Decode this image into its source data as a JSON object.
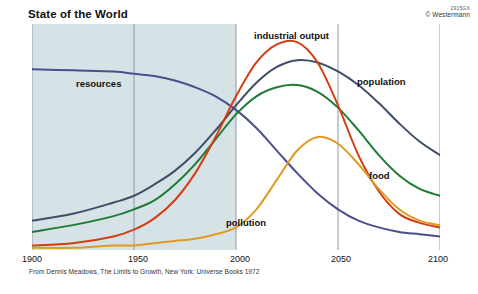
{
  "title": "State of the World",
  "credit": {
    "code": "2915GX",
    "owner": "© Westermann"
  },
  "source_note": "From Dennis Meadows, The Limits to Growth, New York: Universe Books 1972",
  "labels": {
    "resources": "resources",
    "industrial_output": "industrial output",
    "population": "population",
    "food": "food",
    "pollution": "pollution"
  },
  "axis": {
    "ticks": [
      "1900",
      "1950",
      "2000",
      "2100"
    ],
    "tick_2050": "2050"
  },
  "colors": {
    "resources": "#4a4f8c",
    "population": "#3d4f66",
    "food": "#1f7a35",
    "industrial_output": "#d23d12",
    "pollution": "#e09a22",
    "shading": "#d6e3e6",
    "gridline": "#8c9aa5"
  },
  "chart_data": {
    "type": "line",
    "title": "State of the World",
    "xlabel": "",
    "ylabel": "",
    "xlim": [
      1900,
      2100
    ],
    "ylim": [
      0,
      100
    ],
    "grid": true,
    "gridlines_x": [
      1900,
      1950,
      2000,
      2050,
      2100
    ],
    "tick_labels": [
      "1900",
      "1950",
      "2000",
      "2050",
      "2100"
    ],
    "legend": "inline-labels",
    "shaded_region": {
      "from": 1900,
      "to": 2000,
      "note": "historical period shading"
    },
    "x": [
      1900,
      1920,
      1940,
      1950,
      1960,
      1970,
      1980,
      1990,
      2000,
      2010,
      2020,
      2030,
      2040,
      2050,
      2060,
      2070,
      2080,
      2090,
      2100
    ],
    "series": [
      {
        "name": "resources",
        "color": "#4a4f8c",
        "values": [
          80,
          79.5,
          79,
          78,
          77,
          75,
          72,
          68,
          62,
          54,
          44,
          34,
          25,
          18,
          13,
          10,
          8,
          7,
          6
        ]
      },
      {
        "name": "population",
        "color": "#3d4f66",
        "values": [
          13,
          16,
          21,
          24,
          29,
          35,
          43,
          53,
          64,
          74,
          81,
          84,
          83,
          79,
          73,
          65,
          56,
          48,
          42
        ]
      },
      {
        "name": "food",
        "color": "#1f7a35",
        "values": [
          8,
          11,
          15,
          18,
          22,
          29,
          38,
          49,
          60,
          68,
          72,
          73,
          70,
          63,
          53,
          42,
          33,
          27,
          24
        ]
      },
      {
        "name": "industrial output",
        "color": "#d23d12",
        "values": [
          2,
          3,
          6,
          9,
          14,
          22,
          34,
          50,
          68,
          83,
          91,
          92,
          83,
          64,
          42,
          26,
          16,
          12,
          10
        ]
      },
      {
        "name": "pollution",
        "color": "#e09a22",
        "values": [
          1,
          1,
          2,
          2,
          3,
          4,
          5,
          7,
          10,
          18,
          31,
          44,
          50,
          47,
          38,
          27,
          18,
          13,
          11
        ]
      }
    ]
  }
}
